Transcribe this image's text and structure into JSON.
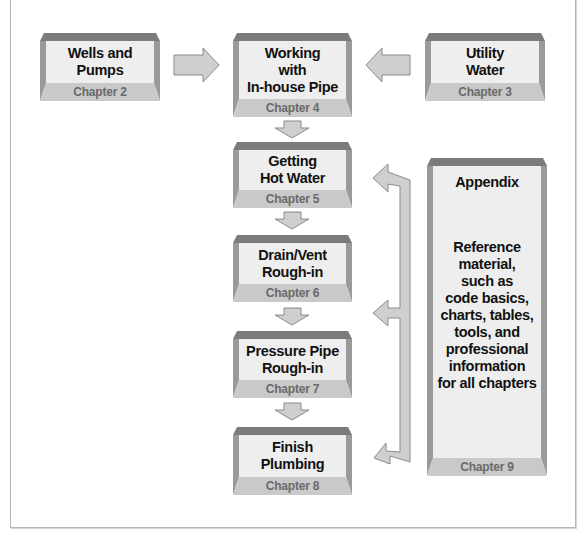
{
  "diagram": {
    "colors": {
      "bevel_top": "#7b7b7b",
      "bevel_side": "#9a9a9a",
      "face": "#eeeeee",
      "footer": "#c9c9c9",
      "arrow_fill": "#cfcfcf",
      "arrow_stroke": "#8a8a8a"
    },
    "boxes": [
      {
        "id": "wells",
        "title": "Wells and\nPumps",
        "chapter": "Chapter 2"
      },
      {
        "id": "in-house",
        "title": "Working\nwith\nIn-house Pipe",
        "chapter": "Chapter 4"
      },
      {
        "id": "utility",
        "title": "Utility\nWater",
        "chapter": "Chapter 3"
      },
      {
        "id": "hot-water",
        "title": "Getting\nHot Water",
        "chapter": "Chapter 5"
      },
      {
        "id": "drain-vent",
        "title": "Drain/Vent\nRough-in",
        "chapter": "Chapter 6"
      },
      {
        "id": "pressure-pipe",
        "title": "Pressure Pipe\nRough-in",
        "chapter": "Chapter 7"
      },
      {
        "id": "finish",
        "title": "Finish\nPlumbing",
        "chapter": "Chapter 8"
      }
    ],
    "appendix": {
      "title": "Appendix",
      "body": "Reference\nmaterial,\nsuch as\ncode basics,\ncharts, tables,\ntools, and\nprofessional\ninformation\nfor all chapters",
      "chapter": "Chapter 9"
    },
    "flows": [
      "Chapter 2 -> Chapter 4",
      "Chapter 3 -> Chapter 4",
      "Chapter 4 -> Chapter 5",
      "Chapter 5 -> Chapter 6",
      "Chapter 6 -> Chapter 7",
      "Chapter 7 -> Chapter 8",
      "Chapter 9 -> Chapters 5, 6-7, 8"
    ]
  }
}
